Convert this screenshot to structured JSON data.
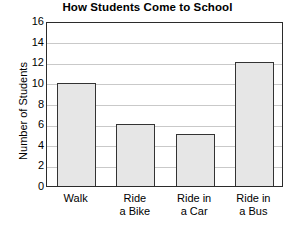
{
  "chart_data": {
    "type": "bar",
    "title": "How Students Come to School",
    "xlabel": "",
    "ylabel": "Number of Students",
    "categories": [
      "Walk",
      "Ride a Bike",
      "Ride in a Car",
      "Ride in a Bus"
    ],
    "category_lines": [
      [
        "Walk"
      ],
      [
        "Ride",
        "a Bike"
      ],
      [
        "Ride in",
        "a Car"
      ],
      [
        "Ride in",
        "a Bus"
      ]
    ],
    "values": [
      10,
      6,
      5,
      12
    ],
    "ylim": [
      0,
      16
    ],
    "ytick_step": 2,
    "yticks": [
      0,
      2,
      4,
      6,
      8,
      10,
      12,
      14,
      16
    ],
    "ytick_labels": [
      "0",
      "2",
      "4",
      "6",
      "8",
      "10",
      "12",
      "14",
      "16"
    ],
    "grid": true,
    "grid_axis": "y",
    "legend": false,
    "legend_position": "none",
    "colors": {
      "bar_fill": "#e6e6e6",
      "bar_edge": "#333333",
      "gridline": "#c9c9c9",
      "frame": "#2b2b2b",
      "text": "#000000",
      "background": "#ffffff"
    }
  }
}
